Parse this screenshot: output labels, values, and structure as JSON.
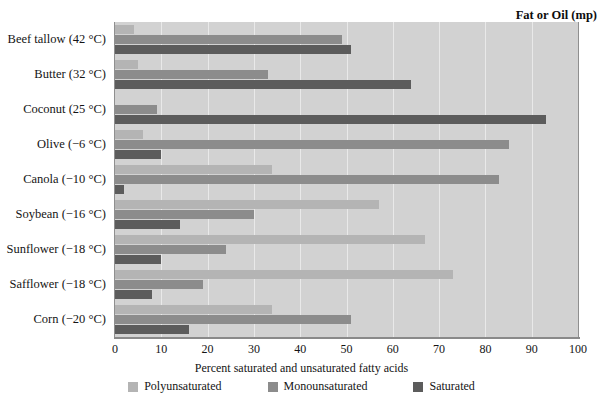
{
  "header": {
    "category_header": "Fat or Oil (mp)"
  },
  "axis": {
    "x_title": "Percent saturated and unsaturated fatty acids",
    "x_ticks": [
      0,
      10,
      20,
      30,
      40,
      50,
      60,
      70,
      80,
      90,
      100
    ],
    "x_min": 0,
    "x_max": 100
  },
  "legend": {
    "items": [
      {
        "label": "Polyunsaturated",
        "color": "#b4b4b4"
      },
      {
        "label": "Monounsaturated",
        "color": "#8c8c8c"
      },
      {
        "label": "Saturated",
        "color": "#5c5c5c"
      }
    ]
  },
  "colors": {
    "plot_background": "#d2d2d2",
    "gridline": "#e9e9e9",
    "frame": "#8f8f8f",
    "polyunsaturated": "#b4b4b4",
    "monounsaturated": "#8c8c8c",
    "saturated": "#5c5c5c"
  },
  "chart_data": {
    "type": "bar",
    "orientation": "horizontal",
    "title": "",
    "xlabel": "Percent saturated and unsaturated fatty acids",
    "ylabel": "Fat or Oil (mp)",
    "xlim": [
      0,
      100
    ],
    "grid": true,
    "legend_position": "bottom",
    "categories": [
      "Beef tallow (42 °C)",
      "Butter (32 °C)",
      "Coconut (25 °C)",
      "Olive (−6 °C)",
      "Canola (−10 °C)",
      "Soybean (−16 °C)",
      "Sunflower (−18 °C)",
      "Safflower (−18 °C)",
      "Corn (−20 °C)"
    ],
    "series": [
      {
        "name": "Polyunsaturated",
        "color": "#b4b4b4",
        "values": [
          4,
          5,
          0,
          6,
          34,
          57,
          67,
          73,
          34
        ]
      },
      {
        "name": "Monounsaturated",
        "color": "#8c8c8c",
        "values": [
          49,
          33,
          9,
          85,
          83,
          30,
          24,
          19,
          51
        ]
      },
      {
        "name": "Saturated",
        "color": "#5c5c5c",
        "values": [
          51,
          64,
          93,
          10,
          2,
          14,
          10,
          8,
          16
        ]
      }
    ]
  }
}
